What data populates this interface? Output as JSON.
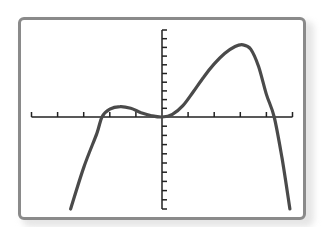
{
  "chart_data": {
    "type": "line",
    "title": "",
    "xlabel": "",
    "ylabel": "",
    "grid": false,
    "legend": null,
    "x_ticks": [
      -5,
      -4,
      -3,
      -2,
      -1,
      0,
      1,
      2,
      3,
      4,
      5
    ],
    "y_tick_count_above": 10,
    "y_tick_count_below": 10,
    "xlim": [
      -5,
      5
    ],
    "ylim": [
      -10,
      10
    ],
    "series": [
      {
        "name": "f(x)",
        "color": "#4a4a4a",
        "x": [
          -3.5,
          -3.0,
          -2.5,
          -2.3,
          -2.0,
          -1.6,
          -1.2,
          -0.8,
          -0.4,
          0,
          0.4,
          0.8,
          1.2,
          1.6,
          2.0,
          2.4,
          2.8,
          3.1,
          3.4,
          3.7,
          4.0,
          4.3,
          4.6,
          4.9
        ],
        "y": [
          -10,
          -5.5,
          -1.8,
          0,
          0.9,
          1.2,
          1.0,
          0.5,
          0.15,
          0,
          0.3,
          1.3,
          2.9,
          4.6,
          6.1,
          7.3,
          8.1,
          8.3,
          7.8,
          5.8,
          2.6,
          0,
          -4.5,
          -10
        ]
      }
    ],
    "features": {
      "x_intercepts": [
        -2.3,
        0,
        4.3
      ],
      "local_maxima": [
        [
          -1.6,
          1.2
        ],
        [
          3.1,
          8.3
        ]
      ],
      "local_minimum": [
        0,
        0
      ]
    }
  },
  "colors": {
    "frame": "#8a8a8a",
    "axis": "#222222",
    "curve": "#4a4a4a",
    "background": "#ffffff"
  }
}
